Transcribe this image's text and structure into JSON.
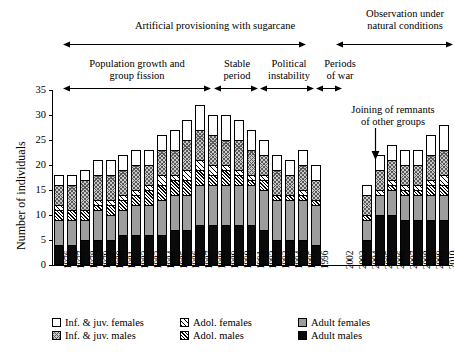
{
  "chart_data": {
    "type": "bar",
    "stacked": true,
    "title": "",
    "xlabel": "",
    "ylabel": "Number of individuals",
    "ylim": [
      0,
      35
    ],
    "ytick_values": [
      0,
      5,
      10,
      15,
      20,
      25,
      30,
      35
    ],
    "grid": false,
    "legend_position": "bottom",
    "categories": [
      "1976",
      "1977",
      "1978",
      "1979",
      "1980",
      "1981",
      "1982",
      "1983",
      "1984",
      "1985",
      "1986",
      "1987",
      "1988",
      "1989",
      "1990",
      "1991",
      "1992",
      "1993",
      "1994",
      "1995",
      "1996",
      "",
      "2002",
      "2003",
      "2004",
      "2005",
      "2006",
      "2007",
      "2008",
      "2009",
      "2010"
    ],
    "series": [
      {
        "name": "Adult males",
        "key": "adult_males",
        "values": [
          4,
          4,
          5,
          5,
          5,
          6,
          6,
          6,
          6,
          7,
          7,
          8,
          8,
          8,
          8,
          8,
          7,
          5,
          5,
          5,
          4,
          0,
          0,
          0,
          5,
          10,
          10,
          9,
          9,
          9,
          9
        ]
      },
      {
        "name": "Adult females",
        "key": "adult_females",
        "values": [
          5,
          5,
          4,
          6,
          5,
          5,
          6,
          6,
          7,
          7,
          7,
          8,
          8,
          8,
          8,
          8,
          8,
          8,
          8,
          8,
          8,
          0,
          0,
          0,
          4,
          4,
          5,
          5,
          5,
          5,
          5
        ]
      },
      {
        "name": "Adol. males",
        "key": "adol_males",
        "values": [
          2,
          2,
          2,
          1,
          2,
          2,
          2,
          3,
          3,
          3,
          3,
          3,
          2,
          3,
          2,
          1,
          2,
          1,
          1,
          1,
          1,
          0,
          0,
          0,
          1,
          0,
          1,
          1,
          1,
          2,
          2
        ]
      },
      {
        "name": "Adol. females",
        "key": "adol_females",
        "values": [
          1,
          0,
          0,
          1,
          1,
          1,
          1,
          1,
          2,
          1,
          2,
          2,
          2,
          1,
          1,
          1,
          1,
          0,
          0,
          1,
          0,
          0,
          0,
          0,
          0,
          1,
          1,
          1,
          1,
          1,
          2
        ]
      },
      {
        "name": "Inf. & juv. males",
        "key": "inf_males",
        "values": [
          4,
          5,
          6,
          5,
          5,
          5,
          5,
          4,
          5,
          5,
          6,
          6,
          6,
          5,
          6,
          5,
          4,
          5,
          4,
          5,
          4,
          0,
          0,
          0,
          4,
          4,
          4,
          4,
          4,
          5,
          5
        ]
      },
      {
        "name": "Inf. & juv. females",
        "key": "inf_females",
        "values": [
          2,
          2,
          2,
          3,
          3,
          3,
          3,
          3,
          3,
          4,
          4,
          5,
          4,
          5,
          4,
          4,
          3,
          3,
          3,
          3,
          3,
          0,
          0,
          0,
          2,
          3,
          3,
          3,
          3,
          4,
          5
        ]
      }
    ],
    "totals": [
      18,
      18,
      19,
      21,
      21,
      22,
      23,
      23,
      26,
      27,
      29,
      32,
      30,
      30,
      29,
      27,
      25,
      22,
      21,
      23,
      20,
      0,
      0,
      0,
      16,
      22,
      24,
      23,
      23,
      26,
      28
    ],
    "annotations": [
      {
        "name": "joining-of-remnants",
        "text": "Joining of remnants\nof other groups",
        "points_to": "2005"
      }
    ],
    "period_bands_top": [
      {
        "label": "Artificial provisioning with sugarcane",
        "from": "1976",
        "to": "1996"
      },
      {
        "label": "Observation under\nnatural conditions",
        "from": "2004",
        "to": "2010"
      }
    ],
    "period_bands_bottom": [
      {
        "label": "Population growth and\ngroup fission",
        "from": "1976",
        "to": "1986"
      },
      {
        "label": "Stable\nperiod",
        "from": "1987",
        "to": "1990"
      },
      {
        "label": "Political\ninstability",
        "from": "1991",
        "to": "1995"
      },
      {
        "label": "Periods\nof war",
        "from": "1996",
        "to": "1996"
      }
    ]
  },
  "legend": {
    "items": [
      {
        "label": "Inf. & juv. females",
        "key": "inf_females"
      },
      {
        "label": "Adol. females",
        "key": "adol_females"
      },
      {
        "label": "Adult females",
        "key": "adult_females"
      },
      {
        "label": "Inf. & juv. males",
        "key": "inf_males"
      },
      {
        "label": "Adol. males",
        "key": "adol_males"
      },
      {
        "label": "Adult males",
        "key": "adult_males"
      }
    ]
  },
  "colors": {
    "adult_males": "#0a0a0a",
    "adult_females": "#9d9d9d",
    "inf_males": "#c9c9c9",
    "axis": "#000000",
    "background": "#ffffff"
  }
}
